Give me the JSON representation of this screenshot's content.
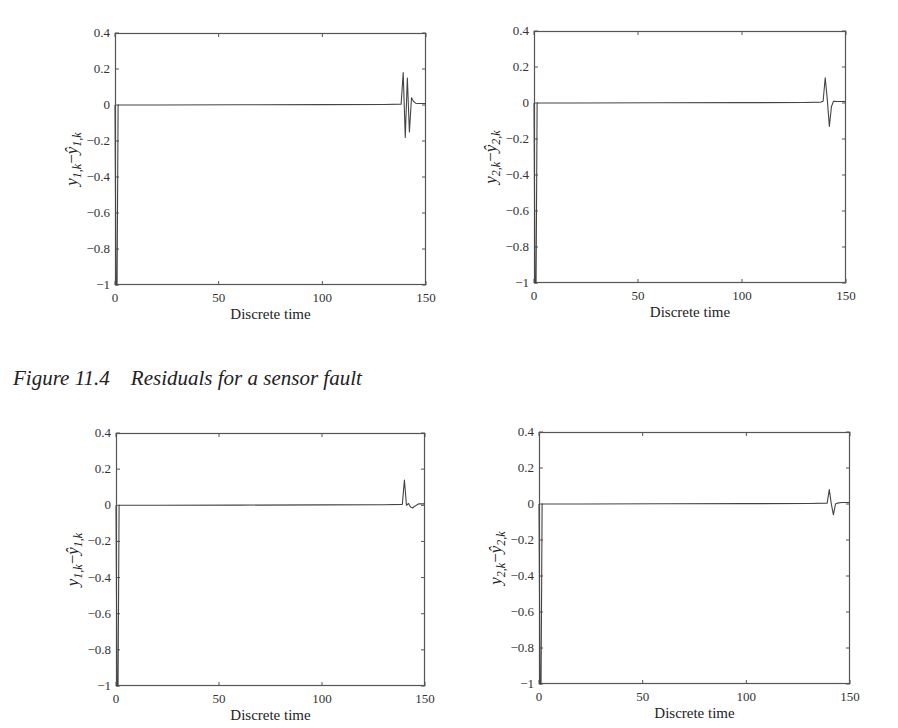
{
  "caption": {
    "figure": "Figure 11.4",
    "text": "Residuals for a sensor fault"
  },
  "chart_data": [
    {
      "type": "line",
      "position": "top-left",
      "xlabel": "Discrete time",
      "ylabel": "y_{1,k} - ŷ_{1,k}",
      "ylabel_parts": {
        "base": "y",
        "sub": "1,k",
        "minus": "−",
        "hat_base": "ŷ",
        "hat_sub": "1,k"
      },
      "xlim": [
        0,
        150
      ],
      "ylim": [
        -1,
        0.4
      ],
      "xticks": [
        0,
        50,
        100,
        150
      ],
      "yticks": [
        0.4,
        0.2,
        0,
        -0.2,
        -0.4,
        -0.6,
        -0.8,
        -1
      ],
      "ytick_labels": [
        "0.4",
        "0.2",
        "0",
        "−0.2",
        "−0.4",
        "−0.6",
        "−0.8",
        "−1"
      ],
      "grid": false,
      "series": [
        {
          "name": "residual 1",
          "x": [
            0,
            0.5,
            1,
            1.5,
            2,
            20,
            60,
            100,
            130,
            138,
            139,
            140,
            141,
            142,
            143,
            144,
            145,
            146,
            147,
            150
          ],
          "y": [
            0,
            -1,
            -1,
            0,
            0,
            0,
            0.001,
            0.002,
            0.003,
            0.005,
            0.18,
            -0.18,
            0.15,
            -0.15,
            0.04,
            0.02,
            0.01,
            0.008,
            0.008,
            0.008
          ]
        }
      ]
    },
    {
      "type": "line",
      "position": "top-right",
      "xlabel": "Discrete time",
      "ylabel": "y_{2,k} - ŷ_{2,k}",
      "ylabel_parts": {
        "base": "y",
        "sub": "2,k",
        "minus": "−",
        "hat_base": "ŷ",
        "hat_sub": "2,k"
      },
      "xlim": [
        0,
        150
      ],
      "ylim": [
        -1,
        0.4
      ],
      "xticks": [
        0,
        50,
        100,
        150
      ],
      "yticks": [
        0.4,
        0.2,
        0,
        -0.2,
        -0.4,
        -0.6,
        -0.8,
        -1
      ],
      "ytick_labels": [
        "0.4",
        "0.2",
        "0",
        "−0.2",
        "−0.4",
        "−0.6",
        "−0.8",
        "−1"
      ],
      "grid": false,
      "series": [
        {
          "name": "residual 2",
          "x": [
            0,
            0.5,
            1,
            1.5,
            2,
            20,
            60,
            100,
            130,
            138,
            139,
            140,
            141,
            142,
            143,
            144,
            146,
            150
          ],
          "y": [
            0,
            -1,
            -1,
            0,
            0,
            0,
            0.001,
            0.002,
            0.003,
            0.005,
            0.01,
            0.14,
            0.02,
            -0.13,
            -0.02,
            0.01,
            0.008,
            0.008
          ]
        }
      ]
    },
    {
      "type": "line",
      "position": "bottom-left",
      "xlabel": "Discrete time",
      "ylabel": "y_{1,k} - ŷ_{1,k}",
      "ylabel_parts": {
        "base": "y",
        "sub": "1,k",
        "minus": "−",
        "hat_base": "ŷ",
        "hat_sub": "1,k"
      },
      "xlim": [
        0,
        150
      ],
      "ylim": [
        -1,
        0.4
      ],
      "xticks": [
        0,
        50,
        100,
        150
      ],
      "yticks": [
        0.4,
        0.2,
        0,
        -0.2,
        -0.4,
        -0.6,
        -0.8,
        -1
      ],
      "ytick_labels": [
        "0.4",
        "0.2",
        "0",
        "−0.2",
        "−0.4",
        "−0.6",
        "−0.8",
        "−1"
      ],
      "grid": false,
      "series": [
        {
          "name": "residual 1",
          "x": [
            0,
            0.5,
            1,
            1.5,
            2,
            20,
            60,
            100,
            130,
            139,
            140,
            141,
            142,
            143,
            144,
            145,
            147,
            150
          ],
          "y": [
            0,
            -1,
            -1,
            0,
            0,
            0,
            0.001,
            0.002,
            0.003,
            0.005,
            0.14,
            0.0,
            0.01,
            -0.01,
            -0.015,
            -0.005,
            0.008,
            0.008
          ]
        }
      ]
    },
    {
      "type": "line",
      "position": "bottom-right",
      "xlabel": "Discrete time",
      "ylabel": "y_{2,k} - ŷ_{2,k}",
      "ylabel_parts": {
        "base": "y",
        "sub": "2,k",
        "minus": "−",
        "hat_base": "ŷ",
        "hat_sub": "2,k"
      },
      "xlim": [
        0,
        150
      ],
      "ylim": [
        -1,
        0.4
      ],
      "xticks": [
        0,
        50,
        100,
        150
      ],
      "yticks": [
        0.4,
        0.2,
        0,
        -0.2,
        -0.4,
        -0.6,
        -0.8,
        -1
      ],
      "ytick_labels": [
        "0.4",
        "0.2",
        "0",
        "−0.2",
        "−0.4",
        "−0.6",
        "−0.8",
        "−1"
      ],
      "grid": false,
      "series": [
        {
          "name": "residual 2",
          "x": [
            0,
            0.5,
            1,
            1.5,
            2,
            20,
            60,
            100,
            130,
            139,
            140,
            141,
            142,
            143,
            144,
            146,
            150
          ],
          "y": [
            0,
            -1,
            -1,
            0,
            0,
            0,
            0.001,
            0.002,
            0.003,
            0.005,
            0.08,
            0.0,
            -0.06,
            0.0,
            0.005,
            0.008,
            0.008
          ]
        }
      ]
    }
  ],
  "layout": {
    "plots": [
      {
        "left": 115,
        "top": 33,
        "right": 426,
        "bottom": 285
      },
      {
        "left": 534,
        "top": 31,
        "right": 846,
        "bottom": 283
      },
      {
        "left": 116,
        "top": 433,
        "right": 425,
        "bottom": 686
      },
      {
        "left": 539,
        "top": 432,
        "right": 850,
        "bottom": 684
      }
    ]
  },
  "colors": {
    "axis": "#555555",
    "line": "#444444",
    "text": "#222222"
  }
}
